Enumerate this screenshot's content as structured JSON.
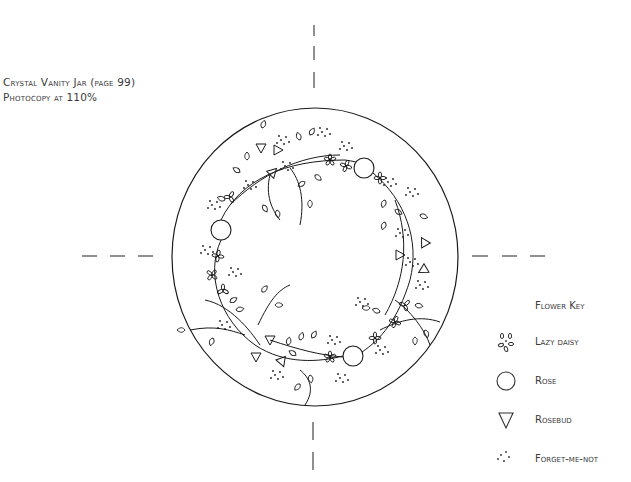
{
  "caption": {
    "title": "Crystal Vanity Jar (page 99)",
    "instruction": "Photocopy at 110%"
  },
  "pattern": {
    "outline": {
      "cx": 315,
      "cy": 257,
      "rx": 143,
      "ry": 149
    },
    "stroke_color": "#1a1a1a",
    "roses": [
      {
        "cx": 364,
        "cy": 168,
        "r": 10
      },
      {
        "cx": 221,
        "cy": 230,
        "r": 10
      },
      {
        "cx": 353,
        "cy": 356,
        "r": 10
      }
    ],
    "crosshair_marks": [
      "top",
      "bottom",
      "left",
      "right"
    ]
  },
  "legend": {
    "title": "Flower Key",
    "items": [
      {
        "icon": "lazy-daisy-icon",
        "label": "Lazy daisy"
      },
      {
        "icon": "rose-icon",
        "label": "Rose"
      },
      {
        "icon": "rosebud-icon",
        "label": "Rosebud"
      },
      {
        "icon": "forget-me-not-icon",
        "label": "Forget-me-not"
      }
    ]
  }
}
